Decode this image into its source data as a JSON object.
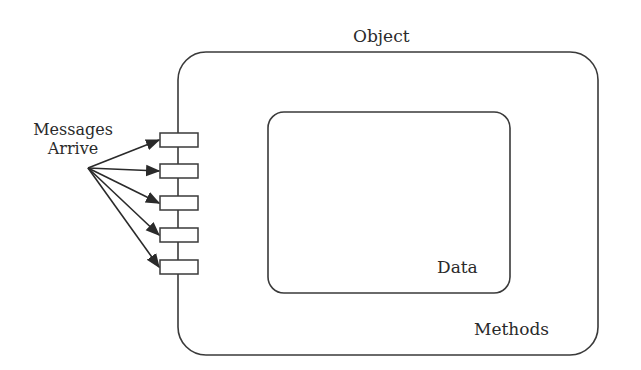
{
  "diagram": {
    "type": "object-model",
    "colors": {
      "stroke": "#3a3a3a",
      "text": "#2a2a2a",
      "background": "#ffffff"
    },
    "object": {
      "label": "Object",
      "x": 178,
      "y": 52,
      "width": 420,
      "height": 303,
      "radius": 28
    },
    "methods": {
      "label": "Methods"
    },
    "data": {
      "label": "Data",
      "x": 268,
      "y": 112,
      "width": 242,
      "height": 181,
      "radius": 16
    },
    "messages": {
      "label_line1": "Messages",
      "label_line2": "Arrive",
      "origin": [
        88,
        168
      ]
    },
    "ports": [
      {
        "x": 160,
        "y": 133,
        "width": 38,
        "height": 14
      },
      {
        "x": 160,
        "y": 164,
        "width": 38,
        "height": 14
      },
      {
        "x": 160,
        "y": 196,
        "width": 38,
        "height": 14
      },
      {
        "x": 160,
        "y": 228,
        "width": 38,
        "height": 14
      },
      {
        "x": 160,
        "y": 260,
        "width": 38,
        "height": 14
      }
    ]
  }
}
